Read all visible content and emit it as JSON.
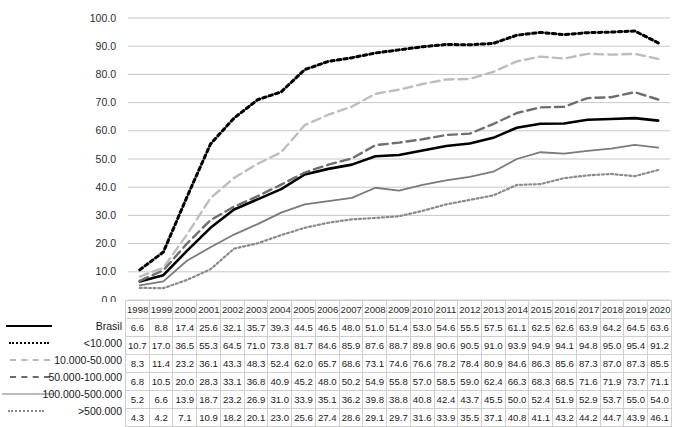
{
  "chart_data": {
    "type": "line",
    "title": "",
    "subtitle": "",
    "xlabel": "",
    "ylabel": "",
    "ylim": [
      0,
      100
    ],
    "ytick_labels": [
      "0.0",
      "10.0",
      "20.0",
      "30.0",
      "40.0",
      "50.0",
      "60.0",
      "70.0",
      "80.0",
      "90.0",
      "100.0"
    ],
    "ytick_values": [
      0,
      10,
      20,
      30,
      40,
      50,
      60,
      70,
      80,
      90,
      100
    ],
    "grid": true,
    "legend_position": "left-bottom-table",
    "categories": [
      "1998",
      "1999",
      "2000",
      "2001",
      "2002",
      "2003",
      "2004",
      "2005",
      "2006",
      "2007",
      "2008",
      "2009",
      "2010",
      "2011",
      "2012",
      "2013",
      "2014",
      "2015",
      "2016",
      "2017",
      "2018",
      "2019",
      "2020"
    ],
    "series": [
      {
        "name": "Brasil",
        "style": "solid-thick",
        "color": "#000000",
        "values": [
          6.6,
          8.8,
          17.4,
          25.6,
          32.1,
          35.7,
          39.3,
          44.5,
          46.5,
          48.0,
          51.0,
          51.4,
          53.0,
          54.6,
          55.5,
          57.5,
          61.1,
          62.5,
          62.6,
          63.9,
          64.2,
          64.5,
          63.6
        ]
      },
      {
        "name": "<10.000",
        "style": "dotted-thick",
        "color": "#000000",
        "values": [
          10.7,
          17.0,
          36.5,
          55.3,
          64.5,
          71.0,
          73.8,
          81.7,
          84.6,
          85.9,
          87.6,
          88.7,
          89.8,
          90.6,
          90.5,
          91.0,
          93.9,
          94.9,
          94.1,
          94.8,
          95.0,
          95.4,
          91.2
        ]
      },
      {
        "name": "10.000-50.000",
        "style": "dashed-light",
        "color": "#bdbdbd",
        "values": [
          8.3,
          11.4,
          23.2,
          36.1,
          43.3,
          48.3,
          52.4,
          62.0,
          65.7,
          68.6,
          73.1,
          74.6,
          76.6,
          78.2,
          78.4,
          80.9,
          84.6,
          86.3,
          85.6,
          87.3,
          87.0,
          87.3,
          85.5
        ]
      },
      {
        "name": "50.000-100.000",
        "style": "dashed-dark",
        "color": "#6e6e6e",
        "values": [
          6.8,
          10.5,
          20.0,
          28.3,
          33.1,
          36.8,
          40.9,
          45.2,
          48.0,
          50.2,
          54.9,
          55.8,
          57.0,
          58.5,
          59.0,
          62.4,
          66.3,
          68.3,
          68.5,
          71.6,
          71.9,
          73.7,
          71.1
        ]
      },
      {
        "name": "100.000-500.000",
        "style": "solid-thin",
        "color": "#7a7a7a",
        "values": [
          5.2,
          6.6,
          13.9,
          18.7,
          23.2,
          26.9,
          31.0,
          33.9,
          35.1,
          36.2,
          39.8,
          38.8,
          40.8,
          42.4,
          43.7,
          45.5,
          50.0,
          52.4,
          51.9,
          52.9,
          53.7,
          55.0,
          54.0
        ]
      },
      {
        "name": ">500.000",
        "style": "dotted-fine",
        "color": "#8a8a8a",
        "values": [
          4.3,
          4.2,
          7.1,
          10.9,
          18.2,
          20.1,
          23.0,
          25.6,
          27.4,
          28.6,
          29.1,
          29.7,
          31.6,
          33.9,
          35.5,
          37.1,
          40.8,
          41.1,
          43.2,
          44.2,
          44.7,
          43.9,
          46.1
        ]
      }
    ]
  },
  "table": {
    "corner_label": "",
    "column_headers": [
      "1998",
      "1999",
      "2000",
      "2001",
      "2002",
      "2003",
      "2004",
      "2005",
      "2006",
      "2007",
      "2008",
      "2009",
      "2010",
      "2011",
      "2012",
      "2013",
      "2014",
      "2015",
      "2016",
      "2017",
      "2018",
      "2019",
      "2020"
    ],
    "rows": [
      {
        "label": "Brasil",
        "values": [
          "6.6",
          "8.8",
          "17.4",
          "25.6",
          "32.1",
          "35.7",
          "39.3",
          "44.5",
          "46.5",
          "48.0",
          "51.0",
          "51.4",
          "53.0",
          "54.6",
          "55.5",
          "57.5",
          "61.1",
          "62.5",
          "62.6",
          "63.9",
          "64.2",
          "64.5",
          "63.6"
        ]
      },
      {
        "label": "<10.000",
        "values": [
          "10.7",
          "17.0",
          "36.5",
          "55.3",
          "64.5",
          "71.0",
          "73.8",
          "81.7",
          "84.6",
          "85.9",
          "87.6",
          "88.7",
          "89.8",
          "90.6",
          "90.5",
          "91.0",
          "93.9",
          "94.9",
          "94.1",
          "94.8",
          "95.0",
          "95.4",
          "91.2"
        ]
      },
      {
        "label": "10.000-50.000",
        "values": [
          "8.3",
          "11.4",
          "23.2",
          "36.1",
          "43.3",
          "48.3",
          "52.4",
          "62.0",
          "65.7",
          "68.6",
          "73.1",
          "74.6",
          "76.6",
          "78.2",
          "78.4",
          "80.9",
          "84.6",
          "86.3",
          "85.6",
          "87.3",
          "87.0",
          "87.3",
          "85.5"
        ]
      },
      {
        "label": "50.000-100.000",
        "values": [
          "6.8",
          "10.5",
          "20.0",
          "28.3",
          "33.1",
          "36.8",
          "40.9",
          "45.2",
          "48.0",
          "50.2",
          "54.9",
          "55.8",
          "57.0",
          "58.5",
          "59.0",
          "62.4",
          "66.3",
          "68.3",
          "68.5",
          "71.6",
          "71.9",
          "73.7",
          "71.1"
        ]
      },
      {
        "label": "100.000-500.000",
        "values": [
          "5.2",
          "6.6",
          "13.9",
          "18.7",
          "23.2",
          "26.9",
          "31.0",
          "33.9",
          "35.1",
          "36.2",
          "39.8",
          "38.8",
          "40.8",
          "42.4",
          "43.7",
          "45.5",
          "50.0",
          "52.4",
          "51.9",
          "52.9",
          "53.7",
          "55.0",
          "54.0"
        ]
      },
      {
        "label": ">500.000",
        "values": [
          "4.3",
          "4.2",
          "7.1",
          "10.9",
          "18.2",
          "20.1",
          "23.0",
          "25.6",
          "27.4",
          "28.6",
          "29.1",
          "29.7",
          "31.6",
          "33.9",
          "35.5",
          "37.1",
          "40.8",
          "41.1",
          "43.2",
          "44.2",
          "44.7",
          "43.9",
          "46.1"
        ]
      }
    ]
  },
  "colors": {
    "gridline": "#c8c8c8",
    "table_border": "#cfcfcf",
    "text": "#1a1a1a",
    "background": "#ffffff"
  }
}
